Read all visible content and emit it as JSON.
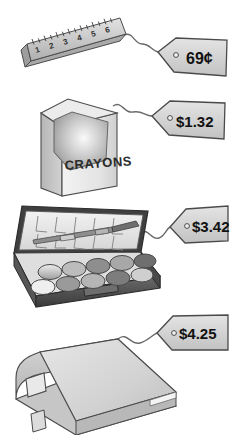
{
  "scene": {
    "title": "School supplies with price tags",
    "background_color": "#ffffff",
    "ink_color": "#333333"
  },
  "items": [
    {
      "id": "ruler",
      "name": "ruler",
      "icon": "ruler-icon",
      "price": "69¢",
      "ruler_marks": [
        "1",
        "2",
        "3",
        "4",
        "5",
        "6"
      ],
      "body_color": "#c9c9c9",
      "edge_color": "#8f8f8f"
    },
    {
      "id": "crayons",
      "name": "crayon box",
      "icon": "crayon-box-icon",
      "label": "CRAYONS",
      "price": "$1.32",
      "body_color": "#e8e8e8",
      "side_color": "#c2c2c2",
      "inner_color": "#a8a8a8"
    },
    {
      "id": "paint-set",
      "name": "watercolor paint set",
      "icon": "paint-set-icon",
      "price": "$3.42",
      "pan_count": 10,
      "case_color": "#4a4a4a",
      "lid_color": "#e4e4e4",
      "pan_colors": [
        "#d9d9d9",
        "#c0c0c0",
        "#8e8e8e",
        "#a6a6a6",
        "#6f6f6f",
        "#efefef",
        "#9a9a9a",
        "#b5b5b5",
        "#7d7d7d",
        "#cfcfcf"
      ]
    },
    {
      "id": "binder",
      "name": "three ring binder",
      "icon": "binder-icon",
      "price": "$4.25",
      "body_color": "#cfcfcf",
      "cover_color": "#dcdcdc",
      "spine_color": "#bdbdbd"
    }
  ],
  "tag": {
    "fill_color": "#d5d5d5",
    "stroke_color": "#4a4a4a",
    "string_color": "#555555"
  }
}
